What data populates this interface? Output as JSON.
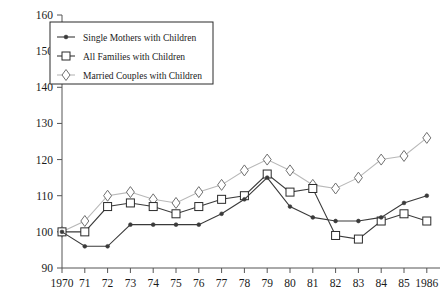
{
  "chart_data": {
    "type": "line",
    "title": "",
    "subtitle": "",
    "xlabel": "",
    "ylabel": "",
    "x": [
      1970,
      1971,
      1972,
      1973,
      1974,
      1975,
      1976,
      1977,
      1978,
      1979,
      1980,
      1981,
      1982,
      1983,
      1984,
      1985,
      1986
    ],
    "x_tick_labels": [
      "1970",
      "71",
      "72",
      "73",
      "74",
      "75",
      "76",
      "77",
      "78",
      "79",
      "80",
      "81",
      "82",
      "83",
      "84",
      "85",
      "1986"
    ],
    "y_tick_labels": [
      "90",
      "100",
      "110",
      "120",
      "130",
      "140",
      "150",
      "160"
    ],
    "y_ticks": [
      90,
      100,
      110,
      120,
      130,
      140,
      150,
      160
    ],
    "ylim": [
      90,
      160
    ],
    "grid": false,
    "legend_position": "top-left",
    "series": [
      {
        "name": "Single Mothers with  Children",
        "marker": "dot",
        "color": "#3a3a3a",
        "values": [
          100,
          96,
          96,
          102,
          102,
          102,
          102,
          105,
          109,
          115,
          107,
          104,
          103,
          103,
          104,
          108,
          110
        ]
      },
      {
        "name": "All Families with Children",
        "marker": "square",
        "color": "#3a3a3a",
        "values": [
          100,
          100,
          107,
          108,
          107,
          105,
          107,
          109,
          110,
          116,
          111,
          112,
          99,
          98,
          103,
          105,
          103
        ]
      },
      {
        "name": "Married Couples with Children",
        "marker": "diamond",
        "color": "#b8b8b8",
        "values": [
          100,
          103,
          110,
          111,
          109,
          108,
          111,
          113,
          117,
          120,
          117,
          113,
          112,
          115,
          120,
          121,
          126
        ]
      }
    ]
  },
  "legend": {
    "entries": [
      {
        "label": "Single Mothers with  Children",
        "marker": "dot"
      },
      {
        "label": "All Families with Children",
        "marker": "square"
      },
      {
        "label": "Married Couples with Children",
        "marker": "diamond"
      }
    ]
  }
}
